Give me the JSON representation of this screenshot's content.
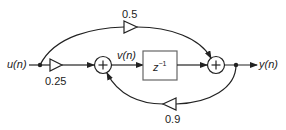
{
  "diagram": {
    "type": "signal-flow",
    "input_label": "u(n)",
    "intermediate_label": "v(n)",
    "output_label": "y(n)",
    "delay_label": "z",
    "delay_exponent": "−1",
    "gains": {
      "feedforward_top": "0.5",
      "input_gain": "0.25",
      "feedback": "0.9"
    },
    "adder_symbol": "+"
  }
}
